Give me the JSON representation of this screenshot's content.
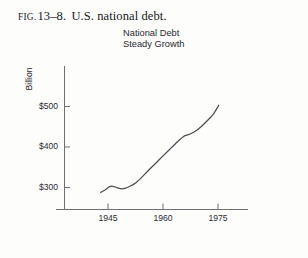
{
  "figure": {
    "caption_prefix": "FIG.",
    "caption_number": "13–8.",
    "caption_text": "U.S. national debt."
  },
  "chart_data": {
    "type": "line",
    "title": "National Debt",
    "subtitle": "Steady Growth",
    "xlabel": "",
    "ylabel": "Billion",
    "xlim": [
      1941,
      1978
    ],
    "ylim": [
      272,
      540
    ],
    "xticks": [
      1945,
      1960,
      1975
    ],
    "xtick_labels": [
      "1945",
      "1960",
      "1975"
    ],
    "yticks": [
      300,
      400,
      500
    ],
    "ytick_labels": [
      "$300",
      "$400",
      "$500"
    ],
    "grid": false,
    "legend": false,
    "line_color": "#4c4c52",
    "axis_color": "#6b6b70",
    "x": [
      1943.0,
      1944.2,
      1945.4,
      1946.3,
      1947.3,
      1948.4,
      1949.6,
      1951.0,
      1952.6,
      1954.2,
      1956.0,
      1958.0,
      1960.0,
      1961.8,
      1963.4,
      1964.8,
      1966.0,
      1967.4,
      1969.0,
      1970.6,
      1972.2,
      1973.8,
      1975.2
    ],
    "y": [
      288,
      294,
      302,
      303,
      300,
      297,
      298,
      303,
      312,
      325,
      342,
      360,
      378,
      394,
      408,
      420,
      428,
      432,
      440,
      452,
      466,
      482,
      503
    ],
    "annotations": []
  }
}
